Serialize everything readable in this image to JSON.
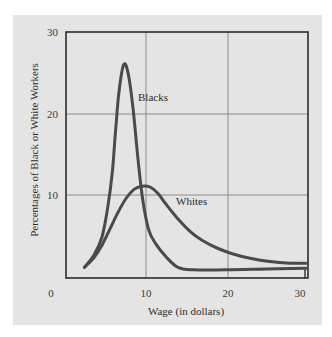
{
  "chart_data": {
    "type": "line",
    "title": "",
    "xlabel": "Wage (in dollars)",
    "ylabel": "Percentages of Black or White Workers",
    "xlim": [
      0,
      30
    ],
    "ylim": [
      0,
      30
    ],
    "x_ticks": [
      "0",
      "10",
      "20",
      "30"
    ],
    "y_ticks": [
      "10",
      "20",
      "30"
    ],
    "origin_label": "0",
    "grid": true,
    "legend": "inline labels",
    "series": [
      {
        "name": "Blacks",
        "label": "Blacks",
        "color": "#4a4a4a",
        "points": [
          [
            2.3,
            1.3
          ],
          [
            3.5,
            2.8
          ],
          [
            4.5,
            5.0
          ],
          [
            5.2,
            8.5
          ],
          [
            5.8,
            13.0
          ],
          [
            6.2,
            18.0
          ],
          [
            6.6,
            22.5
          ],
          [
            7.2,
            26.0
          ],
          [
            7.8,
            24.8
          ],
          [
            8.4,
            20.5
          ],
          [
            9.0,
            14.5
          ],
          [
            9.6,
            9.5
          ],
          [
            10.3,
            6.0
          ],
          [
            11.2,
            4.2
          ],
          [
            12.5,
            2.6
          ],
          [
            14.0,
            1.3
          ],
          [
            16.0,
            1.0
          ],
          [
            20.0,
            1.0
          ],
          [
            25.0,
            1.1
          ],
          [
            30.0,
            1.2
          ]
        ]
      },
      {
        "name": "Whites",
        "label": "Whites",
        "color": "#4a4a4a",
        "points": [
          [
            2.3,
            1.3
          ],
          [
            3.5,
            2.5
          ],
          [
            4.5,
            4.0
          ],
          [
            5.5,
            6.0
          ],
          [
            6.5,
            8.0
          ],
          [
            7.5,
            9.7
          ],
          [
            8.5,
            10.8
          ],
          [
            9.5,
            11.2
          ],
          [
            10.5,
            11.1
          ],
          [
            11.5,
            10.3
          ],
          [
            12.5,
            9.0
          ],
          [
            14.0,
            7.2
          ],
          [
            15.5,
            5.7
          ],
          [
            17.0,
            4.6
          ],
          [
            19.0,
            3.6
          ],
          [
            21.0,
            2.9
          ],
          [
            23.0,
            2.4
          ],
          [
            25.5,
            2.0
          ],
          [
            28.0,
            1.8
          ],
          [
            30.0,
            1.8
          ]
        ]
      }
    ]
  },
  "labels": {
    "origin": "0",
    "x10": "10",
    "x20": "20",
    "x30": "30",
    "y10": "10",
    "y20": "20",
    "y30": "30",
    "xlabel": "Wage (in dollars)",
    "ylabel": "Percentages of Black or White Workers",
    "blacks": "Blacks",
    "whites": "Whites"
  },
  "colors": {
    "panel": "#e4e4e4",
    "frame": "#2b2b2b",
    "grid": "#8c8c8c",
    "curve": "#4a4a4a"
  }
}
